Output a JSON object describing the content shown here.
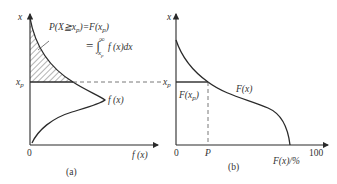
{
  "figure": {
    "panel_a": {
      "caption": "(a)",
      "y_axis_label": "x",
      "x_axis_label": "f (x)",
      "origin_label": "0",
      "xp_label": "x",
      "xp_sub": "p",
      "curve_label": "f (x)",
      "formula_line1": "P(X≧x",
      "formula_line1_sub": "p",
      "formula_line1_rest": ")=F(x",
      "formula_line1_sub2": "p",
      "formula_line1_end": ")",
      "formula_line2": "= ∫",
      "formula_line2_upper": "∞",
      "formula_line2_lower": "x",
      "formula_line2_lower_sub": "p",
      "formula_line2_integrand": "f (x)dx"
    },
    "panel_b": {
      "caption": "(b)",
      "y_axis_label": "x",
      "x_axis_label": "F(x)/%",
      "origin_label": "0",
      "p_label": "P",
      "max_label": "100",
      "xp_label": "x",
      "xp_sub": "p",
      "curve_label": "F(x)",
      "fxp_label": "F(x",
      "fxp_sub": "p",
      "fxp_end": ")"
    },
    "colors": {
      "line": "#2a2a2a",
      "text": "#333333",
      "dash": "#555555"
    }
  }
}
